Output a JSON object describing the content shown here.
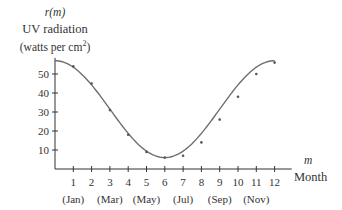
{
  "chart_data": {
    "type": "scatter",
    "title": "",
    "ylabel": {
      "function": "r(m)",
      "line1": "UV radiation",
      "line2": "(watts per cm",
      "superscript": "2",
      "line2_end": ")"
    },
    "xlabel": {
      "variable": "m",
      "text": "Month"
    },
    "xlim": [
      0,
      12.5
    ],
    "ylim": [
      0,
      60
    ],
    "x_ticks": [
      1,
      2,
      3,
      4,
      5,
      6,
      7,
      8,
      9,
      10,
      11,
      12
    ],
    "x_tick_labels": [
      "1",
      "2",
      "3",
      "4",
      "5",
      "6",
      "7",
      "8",
      "9",
      "10",
      "11",
      "12"
    ],
    "x_month_labels": [
      {
        "at": 1,
        "label": "(Jan)"
      },
      {
        "at": 3,
        "label": "(Mar)"
      },
      {
        "at": 5,
        "label": "(May)"
      },
      {
        "at": 7,
        "label": "(Jul)"
      },
      {
        "at": 9,
        "label": "(Sep)"
      },
      {
        "at": 11,
        "label": "(Nov)"
      }
    ],
    "y_ticks": [
      10,
      20,
      30,
      40,
      50
    ],
    "y_tick_labels": [
      "10",
      "20",
      "30",
      "40",
      "50"
    ],
    "grid": false,
    "legend": null,
    "series": [
      {
        "name": "observed UV radiation",
        "kind": "points",
        "x": [
          1,
          2,
          3,
          4,
          5,
          6,
          7,
          8,
          9,
          10,
          11,
          12
        ],
        "y": [
          54,
          45,
          31,
          18,
          9,
          6,
          7,
          14,
          26,
          38,
          50,
          56
        ]
      },
      {
        "name": "fitted curve r(m)",
        "kind": "line",
        "model": "r(m) = 31.5 + 25.5 cos(pi m / 6)",
        "x_range": [
          0,
          12
        ],
        "max": 57,
        "min": 6
      }
    ]
  },
  "colors": {
    "axis": "#333333",
    "curve": "#6e6e6e",
    "points": "#555555"
  }
}
